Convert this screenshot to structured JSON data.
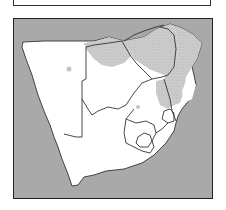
{
  "caption": {
    "text": "",
    "note": "caption text cut off at top edge; only descenders visible"
  },
  "map": {
    "title": "Southern Africa",
    "region": "southern-africa",
    "colors": {
      "ocean": "#a9a9a9",
      "land": "#ffffff",
      "shaded_region": "#c4c4c4",
      "border": "#333333"
    },
    "legend": {
      "shaded": "stippled grey area (distribution range)",
      "unshaded": "white land"
    },
    "countries": [
      {
        "id": "namibia",
        "shaded": false
      },
      {
        "id": "botswana",
        "shaded": "partial-north"
      },
      {
        "id": "zimbabwe",
        "shaded": true
      },
      {
        "id": "mozambique",
        "shaded": "partial"
      },
      {
        "id": "south-africa",
        "shaded": "partial-northeast"
      },
      {
        "id": "lesotho",
        "shaded": false
      },
      {
        "id": "eswatini",
        "shaded": false
      }
    ]
  }
}
